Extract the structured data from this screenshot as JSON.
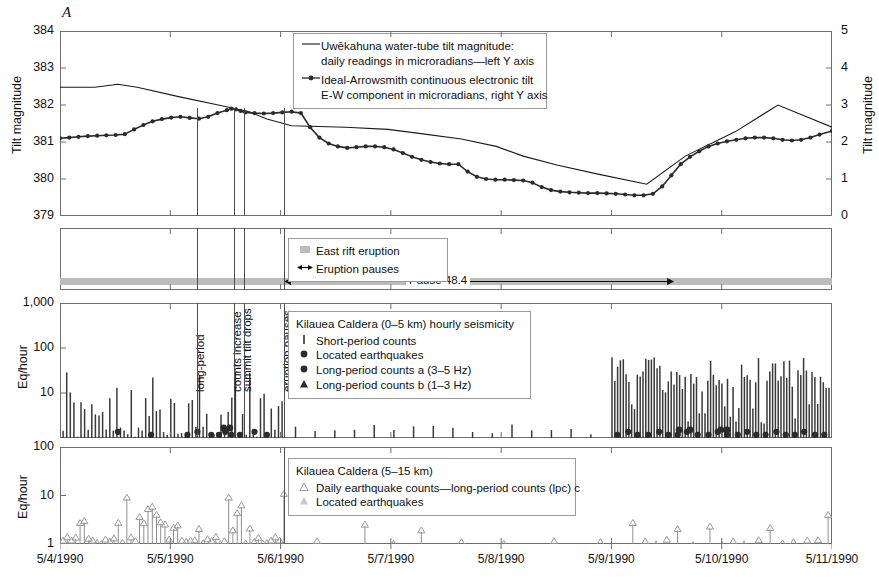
{
  "figure": {
    "panel_letter": "A",
    "x_axis": {
      "labels": [
        "5/4/1990",
        "5/5/1990",
        "5/6/1990",
        "5/7/1990",
        "5/8/1990",
        "5/9/1990",
        "5/10/1990",
        "5/11/1990"
      ],
      "start_day": 4,
      "end_day": 11
    }
  },
  "panel_tilt": {
    "y_left_label": "Tilt magnitude",
    "y_right_label": "Tilt magnitude",
    "y_left_ticks": [
      "384",
      "383",
      "382",
      "381",
      "380",
      "379"
    ],
    "y_right_ticks": [
      "5",
      "4",
      "3",
      "2",
      "1",
      "0"
    ],
    "y_left_range": [
      379,
      384
    ],
    "y_right_range": [
      0,
      5
    ],
    "legend": [
      {
        "symbol": "line",
        "text_line1": "Uwēkahuna water-tube tilt magnitude:",
        "text_line2": "daily readings in microradians—left Y axis"
      },
      {
        "symbol": "line-dot",
        "text_line1": "Ideal-Arrowsmith continuous electronic tilt",
        "text_line2": "E-W component in microradians, right Y axis"
      }
    ]
  },
  "panel_eruption": {
    "legend": [
      {
        "symbol": "gray-square",
        "text": "East rift eruption"
      },
      {
        "symbol": "double-arrow",
        "text": "Eruption pauses"
      }
    ],
    "pause_label": "Pause 48.4"
  },
  "panel_shallow": {
    "y_label": "Eq/hour",
    "y_ticks": [
      "1,000",
      "100",
      "10"
    ],
    "legend_title": "Kilauea Caldera (0–5 km) hourly seismicity",
    "legend": [
      {
        "symbol": "bar",
        "text": "Short-period counts"
      },
      {
        "symbol": "circle",
        "text": "Located earthquakes"
      },
      {
        "symbol": "circle",
        "text": "Long-period counts a (3–5 Hz)"
      },
      {
        "symbol": "triangle",
        "text": "Long-period counts b (1–3 Hz)"
      }
    ],
    "annotations": [
      {
        "label": "long-period",
        "x_frac": 0.1776
      },
      {
        "label": "counts increase",
        "x_frac": 0.2248
      },
      {
        "label": "summit tilt drops",
        "x_frac": 0.2389
      },
      {
        "label": "eruption pauses",
        "x_frac": 0.2901
      }
    ]
  },
  "panel_deep": {
    "y_label": "Eq/hour",
    "y_ticks": [
      "100",
      "10",
      "1"
    ],
    "legend_title": "Kilauea Caldera (5–15 km)",
    "legend": [
      {
        "symbol": "triangle-open",
        "text": "Daily earthquake counts—long-period counts (lpc) c"
      },
      {
        "symbol": "triangle-light",
        "text": "Located earthquakes"
      }
    ]
  },
  "chart_data": {
    "type": "line",
    "xlabel": "Date",
    "x_tick_labels": [
      "5/4/1990",
      "5/5/1990",
      "5/6/1990",
      "5/7/1990",
      "5/8/1990",
      "5/9/1990",
      "5/10/1990",
      "5/11/1990"
    ],
    "grid": false,
    "legend_position": "inside-top",
    "panels": [
      {
        "name": "tilt",
        "ylabel": "Tilt magnitude",
        "ylim_left": [
          379,
          384
        ],
        "ylim_right": [
          0,
          5
        ],
        "series": [
          {
            "name": "Uwēkahuna water-tube tilt magnitude (daily, left Y axis)",
            "axis": "left",
            "style": "line",
            "x": [
              0.0,
              0.045,
              0.075,
              0.1,
              0.155,
              0.205,
              0.245,
              0.268,
              0.3,
              0.37,
              0.425,
              0.47,
              0.52,
              0.565,
              0.6,
              0.645,
              0.7,
              0.76,
              0.81,
              0.875,
              0.93,
              1.0
            ],
            "values": [
              382.48,
              382.48,
              382.56,
              382.48,
              382.22,
              382.0,
              381.82,
              381.62,
              381.44,
              381.4,
              381.34,
              381.22,
              381.08,
              380.88,
              380.62,
              380.37,
              380.12,
              379.86,
              380.62,
              381.28,
              382.0,
              381.4
            ]
          },
          {
            "name": "Ideal-Arrowsmith continuous electronic tilt, E-W (right Y axis)",
            "axis": "right",
            "style": "line-markers",
            "x": [
              0.0,
              0.012,
              0.024,
              0.036,
              0.048,
              0.06,
              0.072,
              0.084,
              0.096,
              0.108,
              0.12,
              0.132,
              0.144,
              0.156,
              0.168,
              0.18,
              0.192,
              0.204,
              0.216,
              0.222,
              0.228,
              0.234,
              0.24,
              0.252,
              0.264,
              0.276,
              0.288,
              0.3,
              0.312,
              0.324,
              0.336,
              0.348,
              0.36,
              0.372,
              0.384,
              0.396,
              0.408,
              0.42,
              0.432,
              0.444,
              0.456,
              0.468,
              0.48,
              0.492,
              0.504,
              0.516,
              0.528,
              0.54,
              0.552,
              0.564,
              0.576,
              0.588,
              0.6,
              0.612,
              0.624,
              0.636,
              0.648,
              0.66,
              0.672,
              0.684,
              0.696,
              0.708,
              0.72,
              0.732,
              0.744,
              0.756,
              0.768,
              0.78,
              0.792,
              0.804,
              0.816,
              0.828,
              0.84,
              0.852,
              0.864,
              0.876,
              0.888,
              0.9,
              0.912,
              0.924,
              0.936,
              0.948,
              0.96,
              0.972,
              0.984,
              1.0
            ],
            "values": [
              2.1,
              2.12,
              2.14,
              2.16,
              2.17,
              2.18,
              2.19,
              2.21,
              2.34,
              2.46,
              2.56,
              2.62,
              2.66,
              2.68,
              2.65,
              2.63,
              2.68,
              2.78,
              2.86,
              2.9,
              2.88,
              2.84,
              2.8,
              2.78,
              2.77,
              2.78,
              2.8,
              2.82,
              2.78,
              2.4,
              2.12,
              1.96,
              1.88,
              1.84,
              1.86,
              1.88,
              1.88,
              1.86,
              1.8,
              1.7,
              1.6,
              1.52,
              1.46,
              1.42,
              1.4,
              1.4,
              1.2,
              1.06,
              1.0,
              0.98,
              0.98,
              0.97,
              0.96,
              0.9,
              0.78,
              0.7,
              0.66,
              0.64,
              0.63,
              0.62,
              0.62,
              0.61,
              0.6,
              0.58,
              0.56,
              0.56,
              0.6,
              0.8,
              1.1,
              1.4,
              1.6,
              1.75,
              1.88,
              1.96,
              2.02,
              2.06,
              2.1,
              2.12,
              2.12,
              2.1,
              2.06,
              2.04,
              2.06,
              2.12,
              2.2,
              2.3
            ]
          }
        ]
      },
      {
        "name": "eruption",
        "annotation": "Pause 48.4",
        "pause_span_frac": [
          0.2901,
          0.7955
        ]
      },
      {
        "name": "shallow_seismicity",
        "ylabel": "Eq/hour",
        "scale": "log",
        "ylim": [
          1,
          1000
        ],
        "description": "Hourly short-period counts (vertical bars) with located earthquakes, long-period counts a and b markers near baseline"
      },
      {
        "name": "deep_seismicity",
        "ylabel": "Eq/hour",
        "scale": "log",
        "ylim": [
          1,
          100
        ],
        "description": "Daily earthquake counts / long-period counts c shown as open triangles with stems"
      }
    ]
  }
}
